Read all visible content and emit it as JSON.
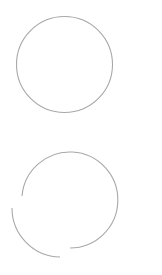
{
  "canvas": {
    "width": 162,
    "height": 275,
    "background": "#ffffff"
  },
  "stroke_color": "#a8a8a8",
  "shapes": [
    {
      "name": "full-circle",
      "type": "circle",
      "cx": 64.5,
      "cy": 64.5,
      "r": 48
    },
    {
      "name": "broken-circle",
      "type": "arcs",
      "arcs": [
        {
          "d": "M 22 196 A 48 48 0 1 1 70 248"
        },
        {
          "d": "M 12 208 A 49 49 0 0 0 60 257"
        }
      ]
    }
  ]
}
